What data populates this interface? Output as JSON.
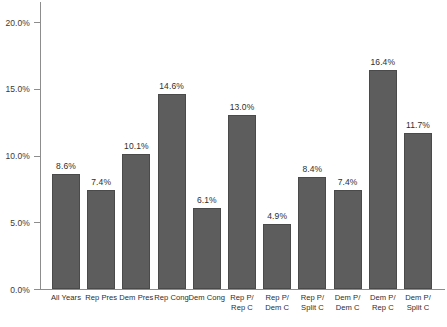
{
  "chart_data": {
    "type": "bar",
    "title": "",
    "subtitle": "",
    "xlabel": "",
    "ylabel": "",
    "ylim": [
      0,
      21.5
    ],
    "grid": false,
    "legend": null,
    "bar_color": "#5d5d5d",
    "axis_color": "#8d8d8d",
    "background": "#ffffff",
    "value_label_format": "one-decimal-percent",
    "yticks": [
      0,
      5,
      10,
      15,
      20
    ],
    "ytick_labels": [
      "0.0%",
      "5.0%",
      "10.0%",
      "15.0%",
      "20.0%"
    ],
    "categories": [
      "All Years",
      "Rep Pres",
      "Dem Pres",
      "Rep Cong",
      "Dem Cong",
      "Rep P/ Rep C",
      "Rep P/ Dem C",
      "Rep P/ Split C",
      "Dem P/ Dem C",
      "Dem P/ Rep C",
      "Dem P/ Split C"
    ],
    "category_lines": [
      [
        "All Years",
        ""
      ],
      [
        "Rep Pres",
        ""
      ],
      [
        "Dem Pres",
        ""
      ],
      [
        "Rep Cong",
        ""
      ],
      [
        "Dem Cong",
        ""
      ],
      [
        "Rep P/",
        "Rep C"
      ],
      [
        "Rep P/",
        "Dem C"
      ],
      [
        "Rep P/",
        "Split C"
      ],
      [
        "Dem P/",
        "Dem C"
      ],
      [
        "Dem P/",
        "Rep C"
      ],
      [
        "Dem P/",
        "Split C"
      ]
    ],
    "values": [
      8.6,
      7.4,
      10.1,
      14.6,
      6.1,
      13.0,
      4.9,
      8.4,
      7.4,
      16.4,
      11.7
    ],
    "value_labels": [
      "8.6%",
      "7.4%",
      "10.1%",
      "14.6%",
      "6.1%",
      "13.0%",
      "4.9%",
      "8.4%",
      "7.4%",
      "16.4%",
      "11.7%"
    ]
  }
}
